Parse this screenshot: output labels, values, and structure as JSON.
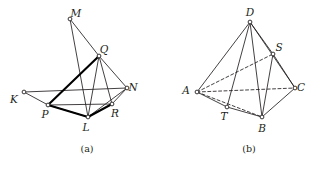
{
  "page": {
    "background_color": "#ffffff",
    "ink_color": "#231f20",
    "width": 320,
    "height": 171
  },
  "figures": [
    {
      "id": "figure-a",
      "caption": "(a)",
      "caption_pos": {
        "x": 87,
        "y": 152
      },
      "description": "Planar net / polyhedron sketch with vertices K, M, Q, N, P, L, R and emphasized heavy edges",
      "vertices": [
        {
          "label": "M",
          "x": 70,
          "y": 19,
          "label_dx": 6,
          "label_dy": -2
        },
        {
          "label": "Q",
          "x": 99,
          "y": 56,
          "label_dx": 5,
          "label_dy": -3
        },
        {
          "label": "N",
          "x": 127,
          "y": 88,
          "label_dx": 6,
          "label_dy": 3
        },
        {
          "label": "K",
          "x": 24,
          "y": 92,
          "label_dx": -10,
          "label_dy": 11
        },
        {
          "label": "P",
          "x": 48,
          "y": 105,
          "label_dx": -3,
          "label_dy": 13
        },
        {
          "label": "R",
          "x": 112,
          "y": 104,
          "label_dx": 3,
          "label_dy": 13
        },
        {
          "label": "L",
          "x": 88,
          "y": 117,
          "label_dx": -2,
          "label_dy": 14
        }
      ],
      "edges_thin": [
        {
          "from": "M",
          "to": "Q"
        },
        {
          "from": "M",
          "to": "L"
        },
        {
          "from": "Q",
          "to": "N"
        },
        {
          "from": "Q",
          "to": "L"
        },
        {
          "from": "Q",
          "to": "R"
        },
        {
          "from": "N",
          "to": "R"
        },
        {
          "from": "N",
          "to": "K"
        },
        {
          "from": "K",
          "to": "P"
        },
        {
          "from": "P",
          "to": "R"
        },
        {
          "from": "P",
          "to": "L"
        },
        {
          "from": "L",
          "to": "R"
        },
        {
          "from": "L",
          "to": "N"
        }
      ],
      "edges_thick": [
        {
          "from": "P",
          "to": "Q"
        },
        {
          "from": "P",
          "to": "L"
        },
        {
          "from": "L",
          "to": "R"
        }
      ]
    },
    {
      "id": "figure-b",
      "caption": "(b)",
      "caption_pos": {
        "x": 249,
        "y": 152
      },
      "description": "Tetrahedron ABCD with point S on edge DC and point T on edge AB, hidden edges dashed",
      "vertices": [
        {
          "label": "D",
          "x": 250,
          "y": 22,
          "label_dx": 0,
          "label_dy": -6
        },
        {
          "label": "S",
          "x": 273,
          "y": 54,
          "label_dx": 6,
          "label_dy": -3
        },
        {
          "label": "A",
          "x": 197,
          "y": 92,
          "label_dx": -11,
          "label_dy": 2
        },
        {
          "label": "C",
          "x": 295,
          "y": 88,
          "label_dx": 6,
          "label_dy": 3
        },
        {
          "label": "T",
          "x": 227,
          "y": 107,
          "label_dx": -3,
          "label_dy": 13
        },
        {
          "label": "B",
          "x": 262,
          "y": 117,
          "label_dx": 0,
          "label_dy": 15
        }
      ],
      "edges_solid": [
        {
          "from": "D",
          "to": "A"
        },
        {
          "from": "D",
          "to": "B"
        },
        {
          "from": "D",
          "to": "C"
        },
        {
          "from": "D",
          "to": "T"
        },
        {
          "from": "D",
          "to": "S"
        },
        {
          "from": "S",
          "to": "B"
        },
        {
          "from": "S",
          "to": "C"
        },
        {
          "from": "A",
          "to": "T"
        },
        {
          "from": "T",
          "to": "B"
        },
        {
          "from": "B",
          "to": "C"
        }
      ],
      "edges_dashed": [
        {
          "from": "A",
          "to": "S"
        },
        {
          "from": "A",
          "to": "C"
        },
        {
          "from": "A",
          "to": "B"
        }
      ]
    }
  ]
}
